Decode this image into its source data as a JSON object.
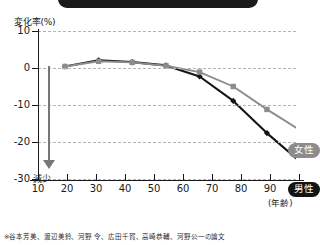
{
  "banner": {
    "present": true,
    "color": "#1a1a1a"
  },
  "axes": {
    "y_caption": "変化率(%)",
    "x_caption": "(年齢)",
    "y_ticks": [
      "10",
      "0",
      "-10",
      "-20",
      "-30"
    ],
    "x_ticks": [
      "10",
      "20",
      "30",
      "40",
      "50",
      "60",
      "70",
      "80",
      "90",
      "100"
    ]
  },
  "annotation": {
    "decrease_label": "減少",
    "arrow": "down-arrow"
  },
  "legend": {
    "female_label": "女性",
    "male_label": "男性"
  },
  "source": {
    "credit": "※谷本芳美、渡辺美鈴、河野 令、広田千賀、高崎恭輔、河野公一の論文"
  },
  "colors": {
    "male": "#141414",
    "female": "#8c8c8c",
    "grid": "#b4b4b4",
    "arrow": "#777777"
  },
  "chart_data": {
    "type": "line",
    "title": "",
    "xlabel": "(年齢)",
    "ylabel": "変化率(%)",
    "xlim": [
      10,
      100
    ],
    "ylim": [
      -30,
      10
    ],
    "grid": true,
    "legend_position": "right-inline",
    "x": [
      18,
      28,
      38,
      48,
      58,
      68,
      78,
      88
    ],
    "series": [
      {
        "name": "男性",
        "marker": "diamond",
        "color": "#141414",
        "values": [
          0.4,
          2.1,
          1.6,
          0.7,
          -2.3,
          -8.9,
          -17.6,
          -25.4
        ]
      },
      {
        "name": "女性",
        "marker": "square",
        "color": "#8c8c8c",
        "values": [
          0.4,
          1.8,
          1.5,
          0.6,
          -1.1,
          -5.0,
          -11.2,
          -16.9
        ]
      }
    ]
  }
}
